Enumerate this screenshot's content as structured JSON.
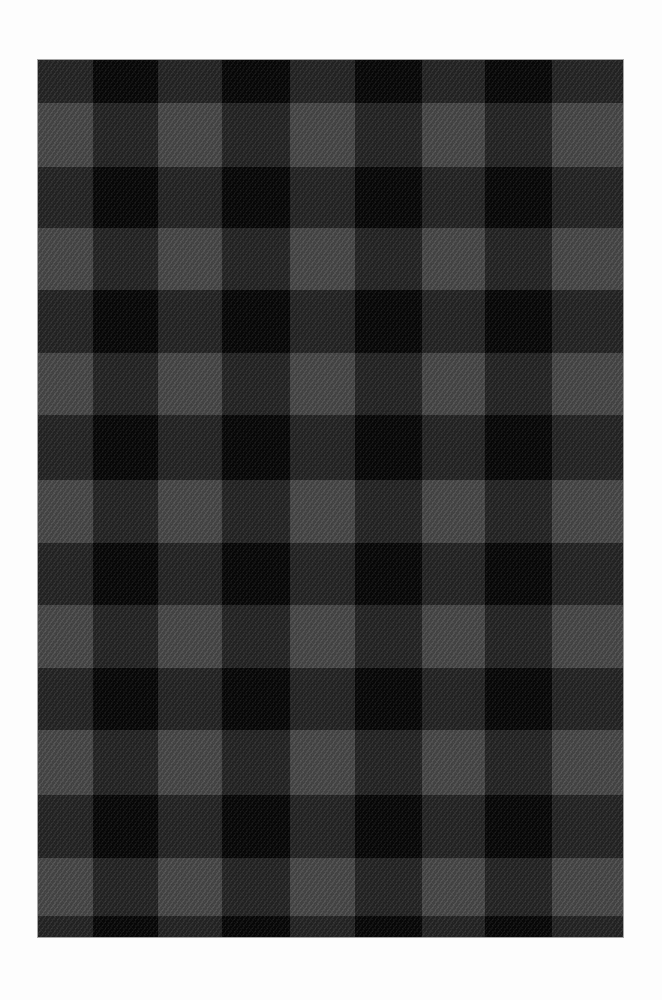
{
  "colors": {
    "background": "#fdfdfd",
    "light_square": "#4a4a4a",
    "mixed_square": "#262626",
    "dark_square": "#080808"
  },
  "swatch": {
    "left": 38,
    "top": 60,
    "width": 585,
    "height": 877
  },
  "columns": [
    {
      "start": 0,
      "end": 55,
      "tone": "light"
    },
    {
      "start": 55,
      "end": 120,
      "tone": "dark"
    },
    {
      "start": 120,
      "end": 184,
      "tone": "light"
    },
    {
      "start": 184,
      "end": 252,
      "tone": "dark"
    },
    {
      "start": 252,
      "end": 317,
      "tone": "light"
    },
    {
      "start": 317,
      "end": 384,
      "tone": "dark"
    },
    {
      "start": 384,
      "end": 447,
      "tone": "light"
    },
    {
      "start": 447,
      "end": 514,
      "tone": "dark"
    },
    {
      "start": 514,
      "end": 585,
      "tone": "light"
    }
  ],
  "rows": [
    {
      "start": 0,
      "end": 43,
      "tone": "dark"
    },
    {
      "start": 43,
      "end": 107,
      "tone": "light"
    },
    {
      "start": 107,
      "end": 168,
      "tone": "dark"
    },
    {
      "start": 168,
      "end": 230,
      "tone": "light"
    },
    {
      "start": 230,
      "end": 293,
      "tone": "dark"
    },
    {
      "start": 293,
      "end": 355,
      "tone": "light"
    },
    {
      "start": 355,
      "end": 420,
      "tone": "dark"
    },
    {
      "start": 420,
      "end": 483,
      "tone": "light"
    },
    {
      "start": 483,
      "end": 545,
      "tone": "dark"
    },
    {
      "start": 545,
      "end": 608,
      "tone": "light"
    },
    {
      "start": 608,
      "end": 670,
      "tone": "dark"
    },
    {
      "start": 670,
      "end": 735,
      "tone": "light"
    },
    {
      "start": 735,
      "end": 798,
      "tone": "dark"
    },
    {
      "start": 798,
      "end": 856,
      "tone": "light"
    },
    {
      "start": 856,
      "end": 877,
      "tone": "dark"
    }
  ]
}
